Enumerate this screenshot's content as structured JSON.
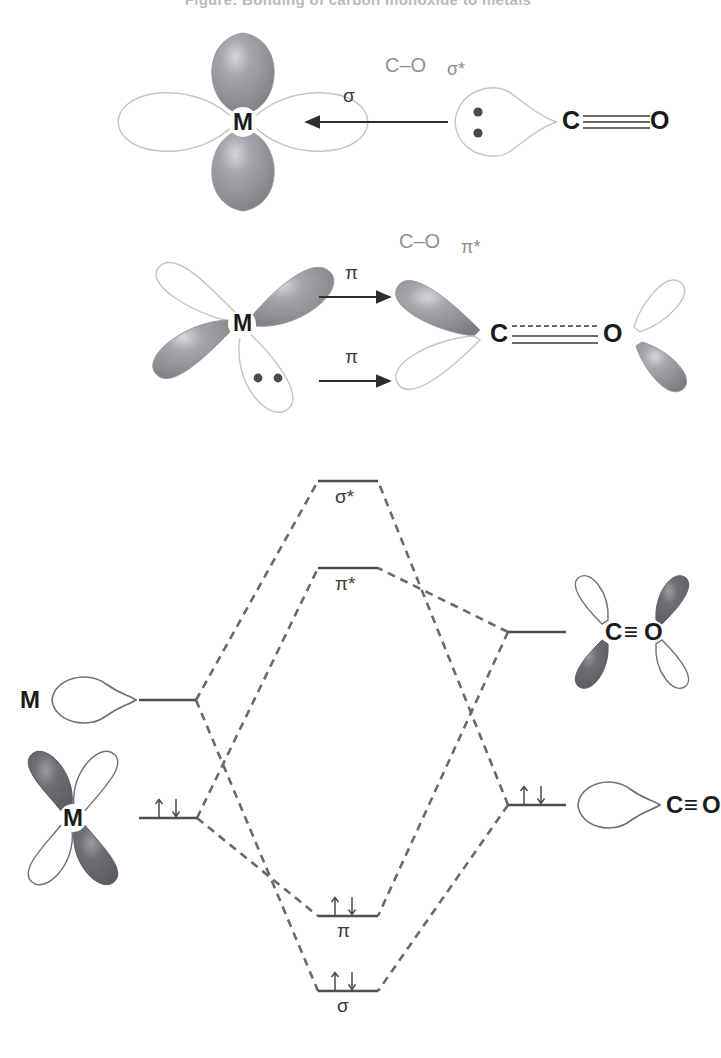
{
  "figure": {
    "title": "Figure:  Bonding of carbon monoxide to metals",
    "type": "diagram",
    "colors": {
      "lobe_shaded": "#8e8e92",
      "lobe_shaded_dark": "#6f6f74",
      "lobe_outline": "#b8b8bc",
      "lobe_white": "#ffffff",
      "bond_line": "#3a3a3a",
      "level_line": "#5c5c60",
      "dashed_correlation": "#6a6a6e",
      "text": "#1a1a1a",
      "label_gray": "#8f8f93"
    }
  },
  "panel_sigma": {
    "name": "sigma-donation",
    "metal_label": "M",
    "arrow_label": "σ",
    "co_orbital_label_part1": "C–O",
    "co_orbital_label_part2": "σ*",
    "carbon_label": "C",
    "oxygen_label": "O",
    "bond_order": "triple",
    "lone_pair_dots": 2,
    "description": "CO sigma lone pair donates into empty metal d orbital"
  },
  "panel_pi": {
    "name": "pi-backbonding",
    "metal_label": "M",
    "arrow_label_top": "π",
    "arrow_label_bottom": "π",
    "co_orbital_label_part1": "C–O",
    "co_orbital_label_part2": "π*",
    "carbon_label": "C",
    "oxygen_label": "O",
    "bond_order": "double-plus-dashed",
    "lone_pair_dots": 2,
    "description": "Filled metal d orbital back-donates into CO pi-star orbital"
  },
  "mo_diagram": {
    "name": "molecular-orbital-diagram",
    "left_fragment": {
      "upper_label": "M",
      "lower_label": "M",
      "upper_electrons": "",
      "lower_electrons": "↑↓"
    },
    "right_fragment": {
      "upper_label_c": "C",
      "upper_label_o": "O",
      "upper_bond": "≡",
      "upper_electrons": "",
      "lower_label_c": "C",
      "lower_label_o": "O",
      "lower_bond": "≡",
      "lower_electrons": "↑↓"
    },
    "levels": [
      {
        "label": "σ*",
        "antibonding": true,
        "electrons": "",
        "y": 481
      },
      {
        "label": "π*",
        "antibonding": true,
        "electrons": "",
        "y": 568
      },
      {
        "label": "π",
        "antibonding": false,
        "electrons": "↑↓",
        "y": 916
      },
      {
        "label": "σ",
        "antibonding": false,
        "electrons": "↑↓",
        "y": 991
      }
    ],
    "fragment_levels": [
      {
        "side": "left",
        "label": "M d (empty)",
        "electrons": "",
        "y": 700
      },
      {
        "side": "left",
        "label": "M d (filled)",
        "electrons": "↑↓",
        "y": 818
      },
      {
        "side": "right",
        "label": "CO π*",
        "electrons": "",
        "y": 632
      },
      {
        "side": "right",
        "label": "CO σ",
        "electrons": "↑↓",
        "y": 805
      }
    ],
    "electron_up": "↑",
    "electron_down": "↓"
  }
}
